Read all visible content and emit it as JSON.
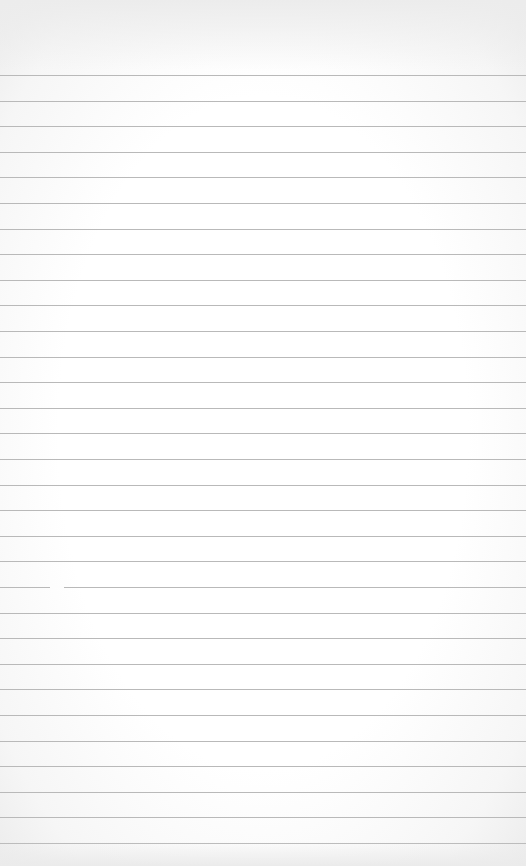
{
  "paper": {
    "type": "lined notebook paper",
    "line_count": 31,
    "first_line_y": 75,
    "line_spacing": 25.6,
    "line_color": "#b9b9b9",
    "background_color": "#fbfbfb"
  }
}
